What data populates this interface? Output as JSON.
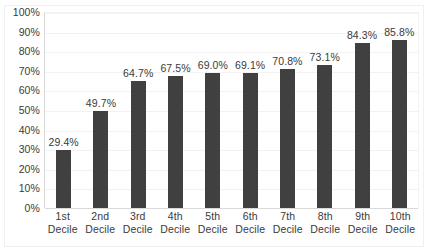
{
  "chart_data": {
    "type": "bar",
    "title": "",
    "xlabel": "",
    "ylabel": "",
    "ylim": [
      0,
      100
    ],
    "grid": true,
    "legend": "none",
    "categories": [
      "1st Decile",
      "2nd Decile",
      "3rd Decile",
      "4th Decile",
      "5th Decile",
      "6th Decile",
      "7th Decile",
      "8th Decile",
      "9th Decile",
      "10th Decile"
    ],
    "category_lines": [
      {
        "line1": "1st",
        "line2": "Decile"
      },
      {
        "line1": "2nd",
        "line2": "Decile"
      },
      {
        "line1": "3rd",
        "line2": "Decile"
      },
      {
        "line1": "4th",
        "line2": "Decile"
      },
      {
        "line1": "5th",
        "line2": "Decile"
      },
      {
        "line1": "6th",
        "line2": "Decile"
      },
      {
        "line1": "7th",
        "line2": "Decile"
      },
      {
        "line1": "8th",
        "line2": "Decile"
      },
      {
        "line1": "9th",
        "line2": "Decile"
      },
      {
        "line1": "10th",
        "line2": "Decile"
      }
    ],
    "values": [
      29.4,
      49.7,
      64.7,
      67.5,
      69.0,
      69.1,
      70.8,
      73.1,
      84.3,
      85.8
    ],
    "data_labels": [
      "29.4%",
      "49.7%",
      "64.7%",
      "67.5%",
      "69.0%",
      "69.1%",
      "70.8%",
      "73.1%",
      "84.3%",
      "85.8%"
    ],
    "y_ticks": [
      100,
      90,
      80,
      70,
      60,
      50,
      40,
      30,
      20,
      10,
      0
    ],
    "y_tick_labels": [
      "100%",
      "90%",
      "80%",
      "70%",
      "60%",
      "50%",
      "40%",
      "30%",
      "20%",
      "10%",
      "0%"
    ],
    "colors": {
      "bar": "#404040",
      "gridline": "#f2f2f2",
      "axis": "#d9d9d9",
      "text": "#3a3a3a",
      "background": "#ffffff"
    }
  }
}
